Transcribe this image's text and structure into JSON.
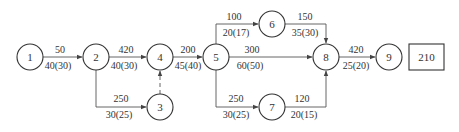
{
  "diagram": {
    "type": "activity-network",
    "nodes": [
      {
        "id": "1",
        "label": "1"
      },
      {
        "id": "2",
        "label": "2"
      },
      {
        "id": "3",
        "label": "3"
      },
      {
        "id": "4",
        "label": "4"
      },
      {
        "id": "5",
        "label": "5"
      },
      {
        "id": "6",
        "label": "6"
      },
      {
        "id": "7",
        "label": "7"
      },
      {
        "id": "8",
        "label": "8"
      },
      {
        "id": "9",
        "label": "9"
      }
    ],
    "edges": [
      {
        "from": "1",
        "to": "2",
        "top": "50",
        "bottom": "40(30)"
      },
      {
        "from": "2",
        "to": "4",
        "top": "420",
        "bottom": "40(30)"
      },
      {
        "from": "2",
        "to": "3",
        "top": "250",
        "bottom": "30(25)"
      },
      {
        "from": "3",
        "to": "4",
        "top": "",
        "bottom": "",
        "dummy": true
      },
      {
        "from": "4",
        "to": "5",
        "top": "200",
        "bottom": "45(40)"
      },
      {
        "from": "5",
        "to": "6",
        "top": "100",
        "bottom": "20(17)"
      },
      {
        "from": "5",
        "to": "8",
        "top": "300",
        "bottom": "60(50)"
      },
      {
        "from": "5",
        "to": "7",
        "top": "250",
        "bottom": "30(25)"
      },
      {
        "from": "6",
        "to": "8",
        "top": "150",
        "bottom": "35(30)"
      },
      {
        "from": "7",
        "to": "8",
        "top": "120",
        "bottom": "20(15)"
      },
      {
        "from": "8",
        "to": "9",
        "top": "420",
        "bottom": "25(20)"
      }
    ],
    "end_box": "210"
  }
}
